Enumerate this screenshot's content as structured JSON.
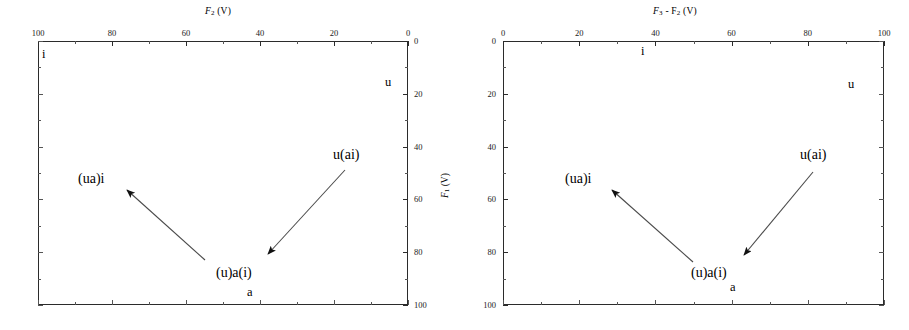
{
  "figure": {
    "background": "#ffffff",
    "ink": "#2b2b2b",
    "panel_count": 2
  },
  "shared": {
    "ylabel_prefix": "F",
    "ylabel_sub": "1",
    "ylabel_unit": " (V)",
    "point_labels": {
      "ua_i": "(ua)i",
      "u_ai": "u(ai)",
      "u_a_i": "(u)a(i)"
    },
    "corner_labels": {
      "i": "i",
      "u": "u",
      "a": "a"
    }
  },
  "left_panel": {
    "name": "F2 vowel plot",
    "title_prefix": "F",
    "title_sub": "2",
    "title_unit": " (V)",
    "x_axis": {
      "position": "top",
      "ticks": [
        "100",
        "80",
        "60",
        "40",
        "20",
        "0"
      ],
      "values": [
        100,
        80,
        60,
        40,
        20,
        0
      ],
      "min": 0,
      "max": 100,
      "reversed": true,
      "minor_per_major": 2
    },
    "y_axis": {
      "position": "right",
      "ticks": [
        "0",
        "20",
        "40",
        "60",
        "80",
        "100"
      ],
      "values": [
        0,
        20,
        40,
        60,
        80,
        100
      ],
      "min": 0,
      "max": 100,
      "reversed": false,
      "minor_per_major": 2
    },
    "labels": {
      "i": "i",
      "u": "u",
      "a": "a",
      "ua_i": "(ua)i",
      "u_ai": "u(ai)",
      "u_a_i": "(u)a(i)"
    }
  },
  "right_panel": {
    "name": "F3 minus F2 vowel plot",
    "title_prefix": "F",
    "title_sub": "3",
    "title_mid": " - F",
    "title_sub2": "2",
    "title_unit": " (V)",
    "x_axis": {
      "position": "top",
      "ticks": [
        "0",
        "20",
        "40",
        "60",
        "80",
        "100"
      ],
      "values": [
        0,
        20,
        40,
        60,
        80,
        100
      ],
      "min": 0,
      "max": 100,
      "reversed": false,
      "minor_per_major": 2
    },
    "y_axis": {
      "position": "left",
      "ticks": [
        "0",
        "20",
        "40",
        "60",
        "80",
        "100"
      ],
      "values": [
        0,
        20,
        40,
        60,
        80,
        100
      ],
      "min": 0,
      "max": 100,
      "reversed": false,
      "minor_per_major": 2
    },
    "labels": {
      "i": "i",
      "u": "u",
      "a": "a",
      "ua_i": "(ua)i",
      "u_ai": "u(ai)",
      "u_a_i": "(u)a(i)"
    }
  },
  "chart_data": {
    "type": "scatter",
    "panels": [
      {
        "title": "F2 (V)",
        "xlabel": "F2 (V)",
        "ylabel": "F1 (V)",
        "xlim": [
          100,
          0
        ],
        "ylim": [
          100,
          0
        ],
        "x_ticks": [
          100,
          80,
          60,
          40,
          20,
          0
        ],
        "y_ticks": [
          0,
          20,
          40,
          60,
          80,
          100
        ],
        "x_axis_side": "top",
        "y_axis_side": "right",
        "grid": false,
        "legend": "none",
        "annotations": [
          {
            "text": "i",
            "x": 99,
            "y": 3,
            "role": "corner-vowel"
          },
          {
            "text": "u",
            "x": 6,
            "y": 17,
            "role": "corner-vowel"
          },
          {
            "text": "a",
            "x": 46,
            "y": 96,
            "role": "corner-vowel"
          },
          {
            "text": "u(ai)",
            "x": 19,
            "y": 45,
            "role": "point-label"
          },
          {
            "text": "(ua)i",
            "x": 86,
            "y": 55,
            "role": "point-label"
          },
          {
            "text": "(u)a(i)",
            "x": 46,
            "y": 89,
            "role": "point-label"
          }
        ],
        "vectors": [
          {
            "name": "to-(ua)i",
            "x_start": 44,
            "y_start": 83,
            "x_end": 78,
            "y_end": 57,
            "arrowhead": "end"
          },
          {
            "name": "to-(u)a(i)",
            "x_start": 25,
            "y_start": 49,
            "x_end": 39,
            "y_end": 80,
            "arrowhead": "end"
          }
        ]
      },
      {
        "title": "F3 - F2 (V)",
        "xlabel": "F3 - F2 (V)",
        "ylabel": "F1 (V)",
        "xlim": [
          0,
          100
        ],
        "ylim": [
          100,
          0
        ],
        "x_ticks": [
          0,
          20,
          40,
          60,
          80,
          100
        ],
        "y_ticks": [
          0,
          20,
          40,
          60,
          80,
          100
        ],
        "x_axis_side": "top",
        "y_axis_side": "left",
        "grid": false,
        "legend": "none",
        "annotations": [
          {
            "text": "i",
            "x": 37,
            "y": 4,
            "role": "corner-vowel"
          },
          {
            "text": "u",
            "x": 89,
            "y": 18,
            "role": "corner-vowel"
          },
          {
            "text": "a",
            "x": 60,
            "y": 93,
            "role": "corner-vowel"
          },
          {
            "text": "u(ai)",
            "x": 82,
            "y": 46,
            "role": "point-label"
          },
          {
            "text": "(ua)i",
            "x": 25,
            "y": 56,
            "role": "point-label"
          },
          {
            "text": "(u)a(i)",
            "x": 49,
            "y": 88,
            "role": "point-label"
          }
        ],
        "vectors": [
          {
            "name": "to-(ua)i",
            "x_start": 49,
            "y_start": 84,
            "x_end": 26,
            "y_end": 58,
            "arrowhead": "end"
          },
          {
            "name": "to-(u)a(i)",
            "x_start": 80,
            "y_start": 50,
            "x_end": 63,
            "y_end": 80,
            "arrowhead": "end"
          }
        ]
      }
    ]
  }
}
